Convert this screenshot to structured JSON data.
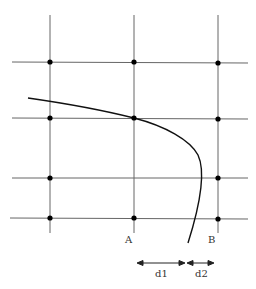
{
  "diagram": {
    "colors": {
      "grid": "#555555",
      "curve": "#111111",
      "dot": "#000000",
      "text": "#333333"
    },
    "vertical_lines_x": [
      50,
      134,
      218
    ],
    "horizontal_lines_y": [
      62,
      118,
      178,
      218
    ],
    "labels": {
      "point_a": "A",
      "point_b": "B",
      "distance_1": "d1",
      "distance_2": "d2"
    }
  }
}
